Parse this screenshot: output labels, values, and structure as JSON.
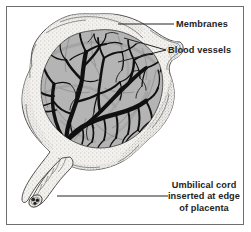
{
  "figure": {
    "frame_border_color": "#6e6e6e",
    "background_color": "#ffffff"
  },
  "colors": {
    "vessel": "#101010",
    "placental_disc": "#b4b4b4",
    "disc_shadow": "#9a9a9a",
    "membrane": "#f2f0ec",
    "membrane_outline": "#4a4a4a",
    "stipple": "#8d8d8d",
    "text": "#242424",
    "leader_line": "#242424"
  },
  "labels": {
    "membranes": {
      "text": "Membranes",
      "icon": "leader-line-icon"
    },
    "blood_vessels": {
      "text": "Blood vessels",
      "icon": "forked-leader-line-icon"
    },
    "umbilical_cord": {
      "line1": "Umbilical cord",
      "line2": "inserted at edge",
      "line3": "of placenta",
      "icon": "leader-line-icon"
    }
  },
  "anatomy": {
    "membrane_name": "amniotic membranes",
    "disc_name": "placental disc",
    "cord_name": "umbilical cord",
    "cord_cut_end": "cut cross-section of umbilical cord"
  }
}
